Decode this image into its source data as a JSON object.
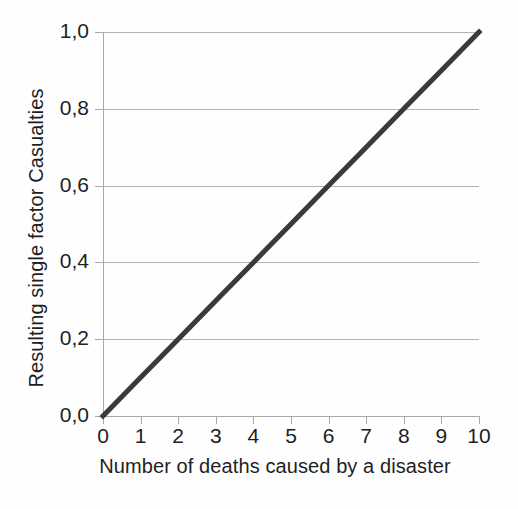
{
  "chart_data": {
    "type": "line",
    "title": "",
    "xlabel": "Number of deaths caused by a disaster",
    "ylabel": "Resulting single factor Casualties",
    "x": [
      0,
      1,
      2,
      3,
      4,
      5,
      6,
      7,
      8,
      9,
      10
    ],
    "series": [
      {
        "name": "Resulting single factor Casualties",
        "values": [
          0.0,
          0.1,
          0.2,
          0.3,
          0.4,
          0.5,
          0.6,
          0.7,
          0.8,
          0.9,
          1.0
        ],
        "color": "#3a3a3a",
        "line_width": 5
      }
    ],
    "xlim": [
      0,
      10
    ],
    "ylim": [
      0.0,
      1.0
    ],
    "xticks": [
      0,
      1,
      2,
      3,
      4,
      5,
      6,
      7,
      8,
      9,
      10
    ],
    "xticklabels": [
      "0",
      "1",
      "2",
      "3",
      "4",
      "5",
      "6",
      "7",
      "8",
      "9",
      "10"
    ],
    "yticks": [
      0.0,
      0.2,
      0.4,
      0.6,
      0.8,
      1.0
    ],
    "yticklabels": [
      "0,0",
      "0,2",
      "0,4",
      "0,6",
      "0,8",
      "1,0"
    ],
    "gridlines": {
      "horizontal": [
        0.2,
        0.4,
        0.6,
        0.8,
        1.0
      ],
      "vertical": [],
      "color": "#b3b3b3"
    },
    "legend": null,
    "legend_position": "none",
    "axis_color": "#a8a8a8",
    "background_color": "#fefefe",
    "decimal_separator": ","
  }
}
